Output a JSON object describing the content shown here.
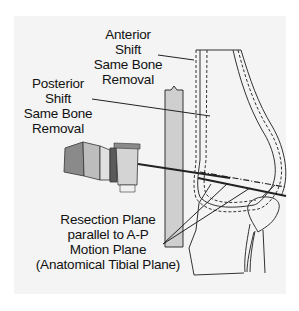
{
  "figure": {
    "labels": {
      "anterior": [
        "Anterior",
        "Shift",
        "Same Bone",
        "Removal"
      ],
      "posterior": [
        "Posterior",
        "Shift",
        "Same Bone",
        "Removal"
      ],
      "resection": [
        "Resection Plane",
        "parallel to A-P",
        "Motion Plane",
        "(Anatomical Tibial Plane)"
      ]
    },
    "colors": {
      "background": "#f4f4f4",
      "outline": "#333333",
      "bar_fill": "#cfcfcf",
      "instrument_dark": "#7a7a7a",
      "instrument_light": "#d8d8d8"
    }
  }
}
